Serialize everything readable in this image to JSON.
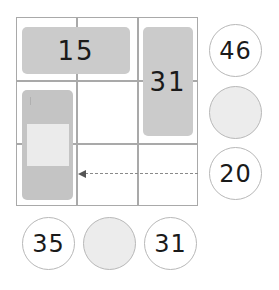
{
  "puzzle": {
    "blocks": {
      "top_horizontal": "15",
      "right_vertical": "31",
      "left_vertical": ""
    },
    "right_circles": [
      "46",
      "",
      "20"
    ],
    "bottom_circles": [
      "35",
      "",
      "31"
    ],
    "colors": {
      "grid_line": "#a9a9a9",
      "block_fill": "#cbcbcb",
      "blank_fill": "#ececec",
      "circle_border": "#b8b8b8",
      "text": "#1a1a1a"
    }
  }
}
